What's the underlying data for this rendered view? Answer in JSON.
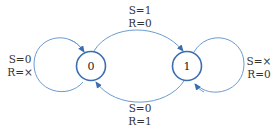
{
  "diagram": {
    "type": "state-diagram",
    "colors": {
      "edge": "#5b8fc7",
      "state_border": "#3b6db0",
      "text": "#333333"
    },
    "states": [
      {
        "id": "s0",
        "label": "0"
      },
      {
        "id": "s1",
        "label": "1"
      }
    ],
    "transitions": [
      {
        "from": "0",
        "to": "0",
        "line1": "S=0",
        "line2": "R=×"
      },
      {
        "from": "0",
        "to": "1",
        "line1": "S=1",
        "line2": "R=0"
      },
      {
        "from": "1",
        "to": "1",
        "line1": "S=×",
        "line2": "R=0"
      },
      {
        "from": "1",
        "to": "0",
        "line1": "S=0",
        "line2": "R=1"
      }
    ]
  }
}
